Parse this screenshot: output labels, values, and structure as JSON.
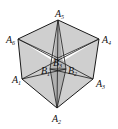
{
  "figure": {
    "colors": {
      "face": "#cfcfcf",
      "white": "#ffffff",
      "lens": "#9a9a9a",
      "stroke": "#1a1a1a"
    },
    "vertices": [
      {
        "name": "A1",
        "base": "A",
        "sub": "1",
        "x": 22,
        "y": 79,
        "lx": 12,
        "ly": 83
      },
      {
        "name": "A2",
        "base": "A",
        "sub": "2",
        "x": 57,
        "y": 108,
        "lx": 52,
        "ly": 122
      },
      {
        "name": "A3",
        "base": "A",
        "sub": "3",
        "x": 93,
        "y": 79,
        "lx": 96,
        "ly": 87
      },
      {
        "name": "A4",
        "base": "A",
        "sub": "4",
        "x": 99,
        "y": 39,
        "lx": 102,
        "ly": 43
      },
      {
        "name": "A5",
        "base": "A",
        "sub": "5",
        "x": 58,
        "y": 20,
        "lx": 55,
        "ly": 17
      },
      {
        "name": "A6",
        "base": "A",
        "sub": "6",
        "x": 18,
        "y": 39,
        "lx": 6,
        "ly": 43
      }
    ],
    "inner_points": [
      {
        "name": "B1",
        "base": "B",
        "sub": "1",
        "x": 50,
        "y": 69,
        "lx": 41,
        "ly": 74
      },
      {
        "name": "B2",
        "base": "B",
        "sub": "2",
        "x": 66,
        "y": 69,
        "lx": 68,
        "ly": 74
      },
      {
        "name": "B3",
        "base": "B",
        "sub": "3",
        "x": 58,
        "y": 58,
        "lx": 53,
        "ly": 66
      }
    ]
  }
}
